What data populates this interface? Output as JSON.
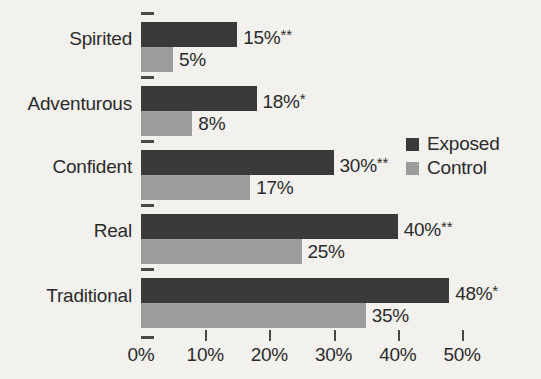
{
  "chart_data": {
    "type": "bar",
    "orientation": "horizontal",
    "title": "",
    "xlabel": "",
    "ylabel": "",
    "categories": [
      "Spirited",
      "Adventurous",
      "Confident",
      "Real",
      "Traditional"
    ],
    "series": [
      {
        "name": "Exposed",
        "color": "#3a3a3a",
        "values": [
          15,
          18,
          30,
          40,
          48
        ],
        "labels": [
          "15%**",
          "18%*",
          "30%**",
          "40%**",
          "48%*"
        ]
      },
      {
        "name": "Control",
        "color": "#9c9c9c",
        "values": [
          5,
          8,
          17,
          25,
          35
        ],
        "labels": [
          "5%",
          "8%",
          "17%",
          "25%",
          "35%"
        ]
      }
    ],
    "xlim": [
      0,
      50
    ],
    "xticks": [
      0,
      10,
      20,
      30,
      40,
      50
    ],
    "xtick_labels": [
      "0%",
      "10%",
      "20%",
      "30%",
      "40%",
      "50%"
    ],
    "grid": false,
    "legend": {
      "position": "right",
      "entries": [
        {
          "label": "Exposed",
          "color": "#3a3a3a"
        },
        {
          "label": "Control",
          "color": "#9c9c9c"
        }
      ]
    },
    "annotations": {
      "significance_markers": [
        "*",
        "**"
      ]
    }
  },
  "colors": {
    "background": "#f2f1ee",
    "text": "#2b2b2b",
    "axis": "#4a4a4a",
    "exposed": "#3a3a3a",
    "control": "#9c9c9c"
  }
}
